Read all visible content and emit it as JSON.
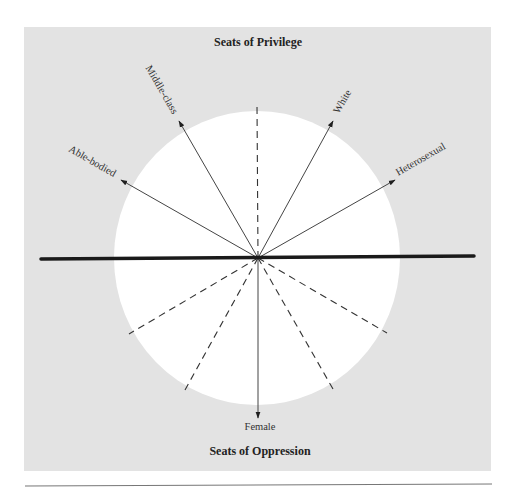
{
  "diagram": {
    "top_title": "Seats of Privilege",
    "bottom_title": "Seats of Oppression",
    "colors": {
      "panel_background": "#e3e3e3",
      "circle_fill": "#ffffff",
      "axis_line": "#1a1a1a",
      "arrow_line": "#444444",
      "dashed_line": "#333333",
      "bottom_rule": "#777777"
    },
    "center": {
      "x": 258,
      "y": 258
    },
    "arrows": [
      {
        "label": "Able-bodied",
        "tip": {
          "x": 121,
          "y": 180
        },
        "direction": "upper-left"
      },
      {
        "label": "Middle-class",
        "tip": {
          "x": 179,
          "y": 121
        },
        "direction": "up-left"
      },
      {
        "label": "White",
        "tip": {
          "x": 333,
          "y": 121
        },
        "direction": "up-right"
      },
      {
        "label": "Heterosexual",
        "tip": {
          "x": 395,
          "y": 180
        },
        "direction": "upper-right"
      },
      {
        "label": "Female",
        "tip": {
          "x": 258,
          "y": 418
        },
        "direction": "down"
      }
    ],
    "dashed_axes": [
      {
        "end": {
          "x": 257,
          "y": 105
        }
      },
      {
        "end": {
          "x": 129,
          "y": 334
        }
      },
      {
        "end": {
          "x": 185,
          "y": 390
        }
      },
      {
        "end": {
          "x": 333,
          "y": 389
        }
      },
      {
        "end": {
          "x": 387,
          "y": 333
        }
      }
    ],
    "horizontal_divider": "thick line separating privilege (above) from oppression (below)"
  }
}
